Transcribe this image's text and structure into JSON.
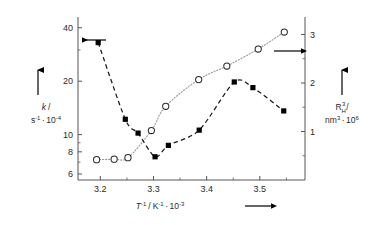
{
  "chart_data": {
    "type": "scatter",
    "title": "",
    "subtitle": "",
    "xlabel": "T^-1 / K^-1 · 10^-3",
    "xlabel_parts": {
      "var": "T",
      "var_sup": "-1",
      "unit": "K",
      "unit_sup": "-1",
      "factor": "10",
      "factor_sup": "-3",
      "arrow": "right-arrow"
    },
    "ylabel_left": "k / s^-1 · 10^-4",
    "ylabel_left_parts": {
      "var": "k",
      "slash": "/",
      "unit": "s",
      "unit_sup": "-1",
      "dot": "·",
      "factor": "10",
      "factor_sup": "-4"
    },
    "ylabel_right": "R_H^3 / nm^3 · 10^6",
    "ylabel_right_parts": {
      "var": "R",
      "var_sub": "H",
      "var_sup": "3",
      "slash": "/",
      "unit": "nm",
      "unit_sup": "3",
      "dot": "·",
      "factor": "10",
      "factor_sup": "6"
    },
    "x": [
      3.2,
      3.3,
      3.4,
      3.5
    ],
    "xtick_labels": [
      "3.2",
      "3.3",
      "3.4",
      "3.5"
    ],
    "xlim": [
      3.158,
      3.585
    ],
    "left_axis": {
      "scale": "log",
      "ylim": [
        5.55,
        46.0
      ],
      "ticks": [
        6,
        8,
        10,
        20,
        40
      ],
      "tick_labels": [
        "6",
        "8",
        "10",
        "20",
        "40"
      ],
      "minor_ticks": [
        7,
        9,
        30
      ]
    },
    "right_axis": {
      "scale": "linear",
      "ylim": [
        0.0,
        3.36
      ],
      "ticks": [
        1,
        2,
        3
      ],
      "tick_labels": [
        "1",
        "2",
        "3"
      ],
      "minor_ticks": [
        0.5,
        1.5,
        2.5
      ]
    },
    "grid": false,
    "legend": "none",
    "series": [
      {
        "name": "k",
        "marker": "filled-square",
        "marker_color": "#000000",
        "line_style": "dashed",
        "line_color": "#1a1a1a",
        "axis": "left",
        "arrow_annotation": "left-arrow",
        "points": [
          {
            "x": 3.196,
            "y": 33.0
          },
          {
            "x": 3.247,
            "y": 12.2
          },
          {
            "x": 3.271,
            "y": 10.2
          },
          {
            "x": 3.303,
            "y": 7.5
          },
          {
            "x": 3.328,
            "y": 8.7
          },
          {
            "x": 3.386,
            "y": 10.6
          },
          {
            "x": 3.452,
            "y": 19.8
          },
          {
            "x": 3.487,
            "y": 18.4
          },
          {
            "x": 3.545,
            "y": 13.6
          }
        ]
      },
      {
        "name": "R_H^3",
        "marker": "open-circle",
        "marker_color": "#ffffff",
        "marker_edge": "#2b2b2b",
        "line_style": "dotted",
        "line_color": "#9a9a9a",
        "axis": "right",
        "arrow_annotation": "right-arrow",
        "points": [
          {
            "x": 3.193,
            "y": 0.42
          },
          {
            "x": 3.226,
            "y": 0.43
          },
          {
            "x": 3.252,
            "y": 0.46
          },
          {
            "x": 3.296,
            "y": 1.02
          },
          {
            "x": 3.323,
            "y": 1.52
          },
          {
            "x": 3.385,
            "y": 2.07
          },
          {
            "x": 3.438,
            "y": 2.35
          },
          {
            "x": 3.497,
            "y": 2.7
          },
          {
            "x": 3.546,
            "y": 3.05
          }
        ]
      }
    ],
    "annotations": [
      {
        "name": "left-axis-arrow",
        "direction": "left",
        "note": "points to left axis"
      },
      {
        "name": "right-axis-arrow",
        "direction": "right",
        "note": "points to right axis"
      },
      {
        "name": "left-label-arrow",
        "direction": "up",
        "note": "above k / s^-1 label"
      },
      {
        "name": "right-label-arrow",
        "direction": "up",
        "note": "above R_H^3 / nm^3 label"
      },
      {
        "name": "xlabel-arrow",
        "direction": "right",
        "note": "after T^-1 label"
      }
    ]
  },
  "colors": {
    "axis": "#555555",
    "text": "#2b2b2b",
    "dashed_line": "#1a1a1a",
    "dotted_line": "#9a9a9a",
    "marker_fill": "#000000",
    "background": "#ffffff"
  }
}
